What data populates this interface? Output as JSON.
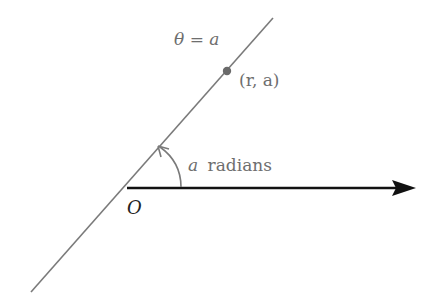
{
  "diagram": {
    "type": "polar-coordinate-line",
    "labels": {
      "line_equation": "θ = a",
      "point": "(r, a)",
      "angle_var": "a",
      "angle_unit": "radians",
      "origin": "O"
    },
    "colors": {
      "background": "#ffffff",
      "line": "#7a7a7a",
      "axis": "#111111",
      "label": "#6e6e6e",
      "origin_label": "#222222",
      "point": "#6a6a6a"
    }
  }
}
